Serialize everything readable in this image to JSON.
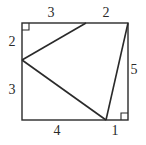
{
  "figure": {
    "type": "geometry-diagram",
    "colors": {
      "stroke": "#2a2a2a",
      "background": "#ffffff"
    }
  },
  "labels": {
    "top_left_segment": "3",
    "top_right_segment": "2",
    "left_upper_segment": "2",
    "left_lower_segment": "3",
    "right_segment": "5",
    "bottom_left_segment": "4",
    "bottom_right_segment": "1"
  },
  "geometry": {
    "rectangle": {
      "width": 5,
      "height": 5
    },
    "triangle_vertices": [
      "point on top side (3 from left)",
      "point on left side (2 from top)",
      "point on bottom side (4 from left)"
    ],
    "extra_segment": "from top-right corner to bottom vertex",
    "right_angle_markers": [
      "top-left",
      "bottom-right"
    ]
  }
}
